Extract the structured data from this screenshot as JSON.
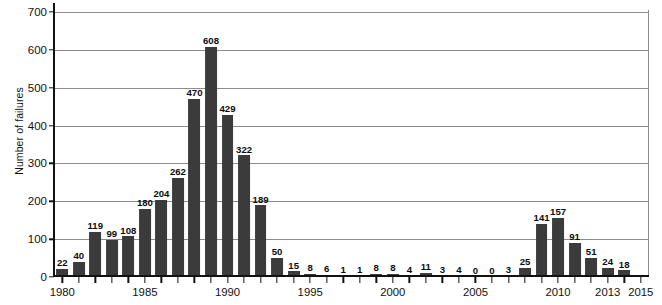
{
  "chart_data": {
    "type": "bar",
    "title": "",
    "xlabel": "",
    "ylabel": "Number of failures",
    "ylim": [
      0,
      700
    ],
    "y_ticks": [
      0,
      100,
      200,
      300,
      400,
      500,
      600,
      700
    ],
    "xlim": [
      1979.5,
      2015.5
    ],
    "x_tick_years": [
      1980,
      1981,
      1982,
      1983,
      1984,
      1985,
      1986,
      1987,
      1988,
      1989,
      1990,
      1991,
      1992,
      1993,
      1994,
      1995,
      1996,
      1997,
      1998,
      1999,
      2000,
      2001,
      2002,
      2003,
      2004,
      2005,
      2006,
      2007,
      2008,
      2009,
      2010,
      2011,
      2012,
      2013,
      2014,
      2015
    ],
    "x_labeled_years": [
      1980,
      1985,
      1990,
      1995,
      2000,
      2005,
      2010,
      2013,
      2015
    ],
    "grid": true,
    "legend": "none",
    "bar_color": "#3b3b3b",
    "grid_color": "#8c8c8c",
    "axis_color": "#111111",
    "categories": [
      1980,
      1981,
      1982,
      1983,
      1984,
      1985,
      1986,
      1987,
      1988,
      1989,
      1990,
      1991,
      1992,
      1993,
      1994,
      1995,
      1996,
      1997,
      1998,
      1999,
      2000,
      2001,
      2002,
      2003,
      2004,
      2005,
      2006,
      2007,
      2008,
      2009,
      2010,
      2011,
      2012,
      2013,
      2014
    ],
    "values": [
      22,
      40,
      119,
      99,
      108,
      180,
      204,
      262,
      470,
      608,
      429,
      322,
      189,
      50,
      15,
      8,
      6,
      1,
      1,
      8,
      8,
      4,
      11,
      3,
      4,
      0,
      0,
      3,
      25,
      141,
      157,
      91,
      51,
      24,
      18
    ],
    "data_labels": [
      "22",
      "40",
      "119",
      "99",
      "108",
      "180",
      "204",
      "262",
      "470",
      "608",
      "429",
      "322",
      "189",
      "50",
      "15",
      "8",
      "6",
      "1",
      "1",
      "8",
      "8",
      "4",
      "11",
      "3",
      "4",
      "0",
      "0",
      "3",
      "25",
      "141",
      "157",
      "91",
      "51",
      "24",
      "18"
    ]
  }
}
